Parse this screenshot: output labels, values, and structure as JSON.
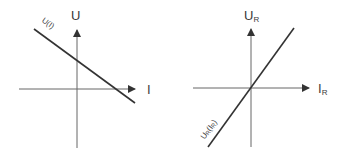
{
  "diagrams": [
    {
      "id": "source",
      "y_axis_label": "U",
      "x_axis_label": "I",
      "curve_label": "U(I)",
      "curve_desc": "falling line, positive U-intercept, positive I-intercept"
    },
    {
      "id": "resistor",
      "y_axis_label_main": "U",
      "y_axis_label_sub": "R",
      "x_axis_label_main": "I",
      "x_axis_label_sub": "R",
      "curve_label_main": "U",
      "curve_label_sub1": "R",
      "curve_label_mid": "(I",
      "curve_label_sub2": "R",
      "curve_label_end": ")",
      "curve_desc": "rising line through origin"
    }
  ],
  "colors": {
    "axis": "#555555",
    "line": "#333333",
    "text": "#3a3a3a"
  }
}
